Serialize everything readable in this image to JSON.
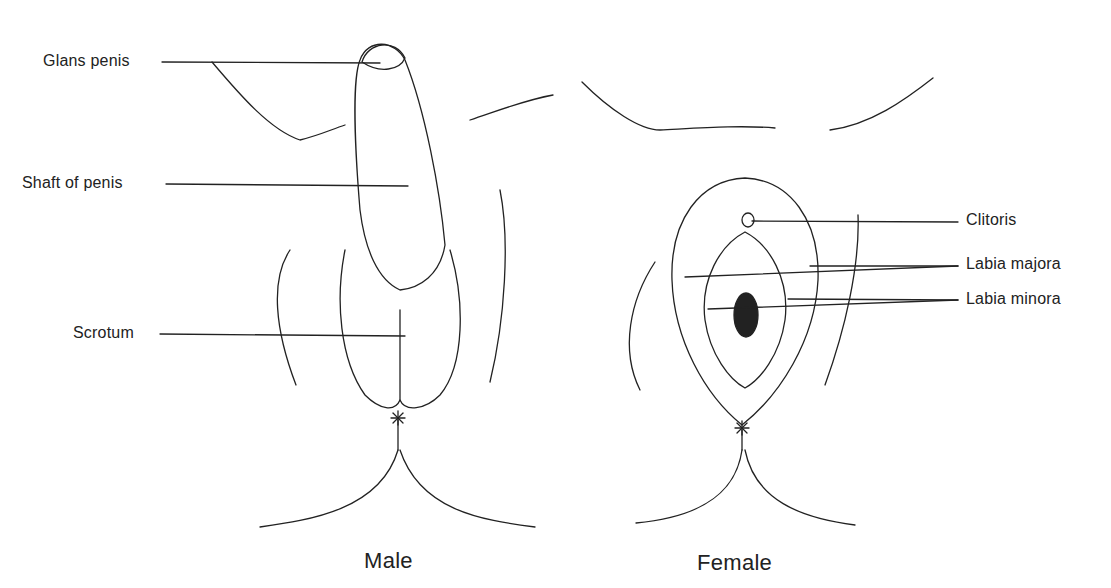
{
  "figure": {
    "type": "anatomical-diagram"
  },
  "male": {
    "caption": "Male",
    "labels": [
      {
        "id": "glans",
        "text": "Glans penis"
      },
      {
        "id": "shaft",
        "text": "Shaft of penis"
      },
      {
        "id": "scrotum",
        "text": "Scrotum"
      }
    ]
  },
  "female": {
    "caption": "Female",
    "labels": [
      {
        "id": "clitoris",
        "text": "Clitoris"
      },
      {
        "id": "labia-majora",
        "text": "Labia majora"
      },
      {
        "id": "labia-minora",
        "text": "Labia minora"
      }
    ]
  },
  "colors": {
    "line": "#222222",
    "background": "#ffffff"
  }
}
